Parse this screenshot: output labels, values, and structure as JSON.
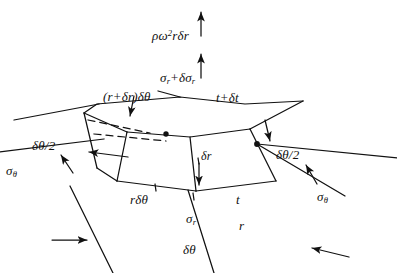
{
  "figure": {
    "background_color": "#ffffff",
    "ink_color": "#111111",
    "width": 397,
    "height": 273
  },
  "labels": {
    "centrifugal_force": "ρω²rδr",
    "radial_stress_outer": "σr+δσr",
    "thickness_outer": "t+δt",
    "outer_arc_length": "(r+δr)δθ",
    "half_angle_left": "δθ/2",
    "half_angle_right": "δθ/2",
    "hoop_stress_left": "σθ",
    "hoop_stress_right": "σθ",
    "radial_thickness": "δr",
    "inner_arc_length": "rδθ",
    "thickness_inner": "t",
    "radial_stress_inner": "σr",
    "radius": "r",
    "subtended_angle": "δθ"
  },
  "label_parts": {
    "centrifugal_force": {
      "rho": "ρ",
      "omega": "ω",
      "exp": "2",
      "r": "r",
      "delta": "δ",
      "dr": "r"
    },
    "radial_stress_outer": {
      "sigma": "σ",
      "sub1": "r",
      "plus": "+",
      "delta": "δ",
      "sigma2": "σ",
      "sub2": "r"
    },
    "thickness_outer": {
      "t": "t",
      "plus": "+",
      "delta": "δ",
      "t2": "t"
    },
    "outer_arc_length": {
      "open": "(",
      "r": "r",
      "plus": "+",
      "delta": "δ",
      "r2": "r",
      "close": ")",
      "delta2": "δ",
      "theta": "θ"
    },
    "half_angle": {
      "delta": "δ",
      "theta": "θ",
      "slash": "/",
      "two": "2"
    },
    "hoop_stress": {
      "sigma": "σ",
      "sub": "θ"
    },
    "radial_thickness": {
      "delta": "δ",
      "r": "r"
    },
    "inner_arc_length": {
      "r": "r",
      "delta": "δ",
      "theta": "θ"
    },
    "radial_stress_inner": {
      "sigma": "σ",
      "sub": "r"
    },
    "subtended_angle": {
      "delta": "δ",
      "theta": "θ"
    },
    "radius": {
      "r": "r"
    },
    "thickness_inner": {
      "t": "t"
    }
  },
  "geometry": {
    "element_description": "curved three-dimensional wedge element cut from a rotating disc",
    "top_face": "M 84,113 L 97,104 L 180,97 L 245,104 L 303,101 L 250,129 L 190,137 L 127,132 Z",
    "front_left_face": "M 84,113 L 127,132 L 117,181 L 97,168 Z",
    "front_face": "M 127,132 L 190,137 L 196,191 L 117,181 Z",
    "right_face": "M 190,137 L 250,129 L 276,181 L 196,191 Z",
    "hidden_edges": [
      "M 88,120 L 148,133",
      "M 94,133 L 168,140"
    ],
    "dots": [
      {
        "name": "hidden-vertex-dot",
        "cx": 166,
        "cy": 134,
        "r": 2.6
      },
      {
        "name": "angle-center-dot",
        "cx": 257,
        "cy": 144,
        "r": 2.8
      }
    ]
  },
  "arrows": {
    "centrifugal_upper": {
      "from": [
        201,
        36
      ],
      "to": [
        201,
        11
      ]
    },
    "radial_stress_upper": {
      "from": [
        201,
        78
      ],
      "to": [
        201,
        53
      ]
    },
    "hoop_left": {
      "from": [
        128,
        157
      ],
      "to": [
        88,
        152
      ]
    },
    "hoop_left_tick": {
      "from": [
        73,
        172
      ],
      "to": [
        60,
        154
      ]
    },
    "half_angle_left_tick": {
      "from": [
        134,
        97
      ],
      "to": [
        129,
        117
      ]
    },
    "half_angle_right_tick": {
      "from": [
        265,
        121
      ],
      "to": [
        271,
        142
      ]
    },
    "hoop_right_tick": {
      "from": [
        316,
        183
      ],
      "to": [
        305,
        164
      ]
    },
    "radial_stress_lower": {
      "from": [
        199,
        163
      ],
      "to": [
        199,
        186
      ]
    },
    "bottom_left_tick": {
      "from": [
        52,
        240
      ],
      "to": [
        88,
        240
      ]
    },
    "bottom_right_tick": {
      "from": [
        348,
        257
      ],
      "to": [
        311,
        248
      ]
    }
  },
  "construction_lines": [
    {
      "name": "left-upper-radial-line",
      "from": [
        14,
        120
      ],
      "to": [
        99,
        104
      ]
    },
    {
      "name": "left-mid-radial-line",
      "from": [
        0,
        152
      ],
      "to": [
        104,
        139
      ]
    },
    {
      "name": "left-lower-radial-line",
      "from": [
        70,
        186
      ],
      "to": [
        113,
        273
      ]
    },
    {
      "name": "right-upper-radial-line",
      "from": [
        257,
        144
      ],
      "to": [
        397,
        158
      ]
    },
    {
      "name": "right-lower-radial-line",
      "from": [
        257,
        144
      ],
      "to": [
        345,
        196
      ]
    },
    {
      "name": "bottom-radial-line",
      "from": [
        188,
        190
      ],
      "to": [
        214,
        273
      ]
    },
    {
      "name": "outer-arc-leader",
      "from": [
        180,
        97
      ],
      "to": [
        160,
        92
      ]
    }
  ]
}
